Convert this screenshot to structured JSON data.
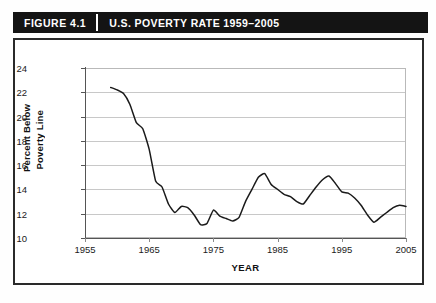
{
  "banner": {
    "figure_number": "FIGURE 4.1",
    "title": "U.S. POVERTY RATE 1959–2005"
  },
  "chart_data": {
    "type": "line",
    "title": "U.S. POVERTY RATE 1959–2005",
    "xlabel": "YEAR",
    "ylabel": "Percent Below Poverty Line",
    "ylabel_line1": "Percent Below",
    "ylabel_line2": "Poverty Line",
    "xlim": [
      1955,
      2005
    ],
    "ylim": [
      10,
      24
    ],
    "xticks": [
      1955,
      1965,
      1975,
      1985,
      1995,
      2005
    ],
    "xtick_labels": [
      "1955",
      "1965",
      "1975",
      "1985",
      "1995",
      "2005"
    ],
    "yticks": [
      10,
      12,
      14,
      16,
      18,
      20,
      22,
      24
    ],
    "ytick_labels": [
      "10",
      "12",
      "14",
      "16",
      "18",
      "20",
      "22",
      "24"
    ],
    "grid": "horizontal",
    "legend": "none",
    "line_color": "#1a1a1a",
    "x": [
      1959,
      1960,
      1961,
      1962,
      1963,
      1964,
      1965,
      1966,
      1967,
      1968,
      1969,
      1970,
      1971,
      1972,
      1973,
      1974,
      1975,
      1976,
      1977,
      1978,
      1979,
      1980,
      1981,
      1982,
      1983,
      1984,
      1985,
      1986,
      1987,
      1988,
      1989,
      1990,
      1991,
      1992,
      1993,
      1994,
      1995,
      1996,
      1997,
      1998,
      1999,
      2000,
      2001,
      2002,
      2003,
      2004,
      2005
    ],
    "values": [
      22.4,
      22.2,
      21.9,
      21.0,
      19.5,
      19.0,
      17.3,
      14.7,
      14.2,
      12.8,
      12.1,
      12.6,
      12.5,
      11.9,
      11.1,
      11.2,
      12.3,
      11.8,
      11.6,
      11.4,
      11.7,
      13.0,
      14.0,
      15.0,
      15.3,
      14.4,
      14.0,
      13.6,
      13.4,
      13.0,
      12.8,
      13.5,
      14.2,
      14.8,
      15.1,
      14.5,
      13.8,
      13.7,
      13.3,
      12.7,
      11.9,
      11.3,
      11.7,
      12.1,
      12.5,
      12.7,
      12.6
    ],
    "units": "percent"
  }
}
